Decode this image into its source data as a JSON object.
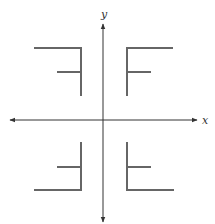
{
  "diagram": {
    "type": "coordinate-plane-reflections",
    "axes": {
      "x_label": "x",
      "y_label": "y",
      "origin": [
        103,
        120
      ],
      "color": "#333333"
    },
    "shape_color": "#666666",
    "figures": [
      {
        "quadrant": "II",
        "description": "F reflected across y-axis",
        "vertical_x": 81,
        "top_y": 48,
        "bottom_y": 95,
        "long_bar_y": 48,
        "long_bar_end_x": 35,
        "short_bar_y": 72,
        "short_bar_end_x": 58
      },
      {
        "quadrant": "I",
        "description": "original letter F",
        "vertical_x": 127,
        "top_y": 48,
        "bottom_y": 95,
        "long_bar_y": 48,
        "long_bar_end_x": 172,
        "short_bar_y": 72,
        "short_bar_end_x": 150
      },
      {
        "quadrant": "III",
        "description": "F rotated 180 degrees",
        "vertical_x": 81,
        "top_y": 143,
        "bottom_y": 190,
        "long_bar_y": 190,
        "long_bar_end_x": 35,
        "short_bar_y": 167,
        "short_bar_end_x": 58
      },
      {
        "quadrant": "IV",
        "description": "F reflected across x-axis",
        "vertical_x": 127,
        "top_y": 143,
        "bottom_y": 190,
        "long_bar_y": 190,
        "long_bar_end_x": 173,
        "short_bar_y": 167,
        "short_bar_end_x": 150
      }
    ]
  }
}
